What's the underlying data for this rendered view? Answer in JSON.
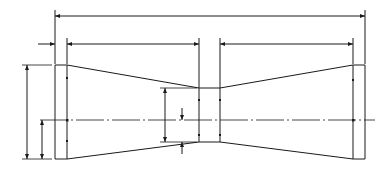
{
  "drawing": {
    "title": "Tapered spool profile (double-cone) dimension drawing",
    "line_color": "#1a1a1a",
    "background": "#ffffff"
  },
  "dimensions": {
    "overall_length": {
      "whole": "7"
    },
    "left_flange_width": {
      "num": "1",
      "den": "4"
    },
    "left_taper_length": {
      "whole": "3"
    },
    "center_width": {
      "num": "1",
      "den": "2"
    },
    "right_taper_length": {
      "whole": "3"
    },
    "end_height": {
      "whole": "2",
      "num": "3",
      "den": "8"
    },
    "end_half_height": {
      "whole": "1",
      "num": "3",
      "den": "16"
    },
    "center_height": {
      "whole": "1",
      "num": "1",
      "den": "4"
    },
    "center_half_height": {
      "num": "5",
      "den": "8"
    }
  }
}
